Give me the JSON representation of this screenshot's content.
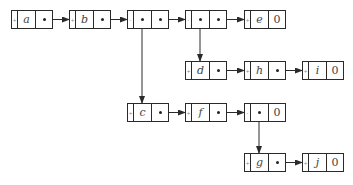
{
  "diagram": {
    "type": "generalized-list",
    "nodes": [
      {
        "id": "n_a",
        "tag": "+",
        "data": "a",
        "data_is_pointer": false,
        "next": "pointer",
        "x": 11,
        "y": 10
      },
      {
        "id": "n_b",
        "tag": "+",
        "data": "b",
        "data_is_pointer": false,
        "next": "pointer",
        "x": 69,
        "y": 10
      },
      {
        "id": "n_s1",
        "tag": "-",
        "data": "",
        "data_is_pointer": true,
        "next": "pointer",
        "x": 127,
        "y": 10
      },
      {
        "id": "n_s2",
        "tag": "-",
        "data": "",
        "data_is_pointer": true,
        "next": "pointer",
        "x": 185,
        "y": 10
      },
      {
        "id": "n_e",
        "tag": "+",
        "data": "e",
        "data_is_pointer": false,
        "next": "0",
        "x": 244,
        "y": 10
      },
      {
        "id": "n_d",
        "tag": "+",
        "data": "d",
        "data_is_pointer": false,
        "next": "pointer",
        "x": 185,
        "y": 61
      },
      {
        "id": "n_h",
        "tag": "+",
        "data": "h",
        "data_is_pointer": false,
        "next": "pointer",
        "x": 244,
        "y": 61
      },
      {
        "id": "n_i",
        "tag": "+",
        "data": "i",
        "data_is_pointer": false,
        "next": "0",
        "x": 302,
        "y": 61
      },
      {
        "id": "n_c",
        "tag": "+",
        "data": "c",
        "data_is_pointer": false,
        "next": "pointer",
        "x": 127,
        "y": 103
      },
      {
        "id": "n_f",
        "tag": "+",
        "data": "f",
        "data_is_pointer": false,
        "next": "pointer",
        "x": 185,
        "y": 103
      },
      {
        "id": "n_s3",
        "tag": "-",
        "data": "",
        "data_is_pointer": true,
        "next": "0",
        "x": 244,
        "y": 103
      },
      {
        "id": "n_g",
        "tag": "+",
        "data": "g",
        "data_is_pointer": false,
        "next": "pointer",
        "x": 244,
        "y": 153
      },
      {
        "id": "n_j",
        "tag": "+",
        "data": "j",
        "data_is_pointer": false,
        "next": "0",
        "x": 302,
        "y": 153
      }
    ],
    "edges": [
      {
        "from": "n_a",
        "to": "n_b",
        "kind": "next"
      },
      {
        "from": "n_b",
        "to": "n_s1",
        "kind": "next"
      },
      {
        "from": "n_s1",
        "to": "n_s2",
        "kind": "next"
      },
      {
        "from": "n_s2",
        "to": "n_e",
        "kind": "next"
      },
      {
        "from": "n_s1",
        "to": "n_c",
        "kind": "sublist"
      },
      {
        "from": "n_s2",
        "to": "n_d",
        "kind": "sublist"
      },
      {
        "from": "n_d",
        "to": "n_h",
        "kind": "next"
      },
      {
        "from": "n_h",
        "to": "n_i",
        "kind": "next"
      },
      {
        "from": "n_c",
        "to": "n_f",
        "kind": "next"
      },
      {
        "from": "n_f",
        "to": "n_s3",
        "kind": "next"
      },
      {
        "from": "n_s3",
        "to": "n_g",
        "kind": "sublist"
      },
      {
        "from": "n_g",
        "to": "n_j",
        "kind": "next"
      }
    ],
    "null_label": "0",
    "colors": {
      "line": "#2a2a2a",
      "text": "#444444",
      "background": "#ffffff"
    }
  }
}
